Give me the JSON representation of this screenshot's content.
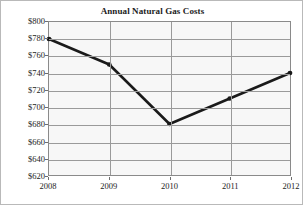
{
  "chart_data": {
    "type": "line",
    "title": "Annual Natural Gas Costs",
    "xlabel": "",
    "ylabel": "",
    "categories": [
      "2008",
      "2009",
      "2010",
      "2011",
      "2012"
    ],
    "values": [
      780,
      750,
      680,
      710,
      740
    ],
    "value_labels": [
      "$780",
      "$750",
      "$680",
      "$710",
      "$740"
    ],
    "ylim": [
      620,
      800
    ],
    "ytick_step": 20,
    "ytick_labels": [
      "$800",
      "$780",
      "$760",
      "$740",
      "$720",
      "$700",
      "$680",
      "$660",
      "$640",
      "$620"
    ],
    "ytick_values": [
      800,
      780,
      760,
      740,
      720,
      700,
      680,
      660,
      640,
      620
    ],
    "xtick_labels": [
      "2008",
      "2009",
      "2010",
      "2011",
      "2012"
    ],
    "grid": true,
    "legend": null,
    "legend_position": "none",
    "series": [
      {
        "name": "Annual Natural Gas Costs",
        "values": [
          780,
          750,
          680,
          710,
          740
        ]
      }
    ],
    "colors": {
      "line": "#1a1a1a",
      "marker": "#1a1a1a",
      "grid": "#9a9a9a",
      "plot_background": "#f7f7f7",
      "axis": "#8a8a8a",
      "text": "#1c1c1c",
      "figure_background": "#ffffff"
    }
  }
}
